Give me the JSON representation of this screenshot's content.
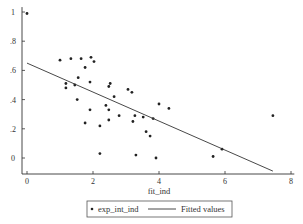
{
  "chart_data": {
    "type": "scatter",
    "title": "",
    "xlabel": "fit_ind",
    "ylabel": "",
    "xlim": [
      -0.1,
      8.1
    ],
    "ylim": [
      -0.1,
      1.02
    ],
    "x_ticks": [
      0,
      2,
      4,
      6,
      8
    ],
    "x_tick_labels": [
      "0",
      "2",
      "4",
      "6",
      "8"
    ],
    "y_ticks": [
      0,
      0.2,
      0.4,
      0.6,
      0.8,
      1
    ],
    "y_tick_labels": [
      "0",
      ".2",
      ".4",
      ".6",
      ".8",
      "1"
    ],
    "grid": false,
    "legend_position": "bottom",
    "series": [
      {
        "name": "exp_int_ind",
        "kind": "scatter",
        "points": [
          [
            0.0,
            0.99
          ],
          [
            1.0,
            0.67
          ],
          [
            1.33,
            0.68
          ],
          [
            1.64,
            0.68
          ],
          [
            1.94,
            0.69
          ],
          [
            2.03,
            0.66
          ],
          [
            1.76,
            0.62
          ],
          [
            1.55,
            0.55
          ],
          [
            1.18,
            0.51
          ],
          [
            1.18,
            0.48
          ],
          [
            1.45,
            0.5
          ],
          [
            1.91,
            0.52
          ],
          [
            2.52,
            0.51
          ],
          [
            2.48,
            0.49
          ],
          [
            2.64,
            0.42
          ],
          [
            1.52,
            0.4
          ],
          [
            1.91,
            0.33
          ],
          [
            1.76,
            0.24
          ],
          [
            2.21,
            0.22
          ],
          [
            2.39,
            0.36
          ],
          [
            2.48,
            0.33
          ],
          [
            2.48,
            0.26
          ],
          [
            2.79,
            0.29
          ],
          [
            2.21,
            0.03
          ],
          [
            3.06,
            0.47
          ],
          [
            3.18,
            0.45
          ],
          [
            3.27,
            0.29
          ],
          [
            3.21,
            0.25
          ],
          [
            3.52,
            0.28
          ],
          [
            3.82,
            0.27
          ],
          [
            4.0,
            0.37
          ],
          [
            4.3,
            0.34
          ],
          [
            3.61,
            0.18
          ],
          [
            3.73,
            0.15
          ],
          [
            3.3,
            0.02
          ],
          [
            3.91,
            0.0
          ],
          [
            7.45,
            0.29
          ],
          [
            5.91,
            0.06
          ],
          [
            5.64,
            0.01
          ]
        ]
      },
      {
        "name": "Fitted values",
        "kind": "line",
        "points": [
          [
            0.0,
            0.65
          ],
          [
            7.45,
            -0.09
          ]
        ]
      }
    ]
  },
  "legend": {
    "items": [
      {
        "label": "exp_int_ind",
        "marker": "dot"
      },
      {
        "label": "Fitted values",
        "marker": "line"
      }
    ]
  },
  "colors": {
    "marker": "#222222",
    "line": "#333333",
    "axis": "#333333",
    "background": "#ffffff"
  }
}
